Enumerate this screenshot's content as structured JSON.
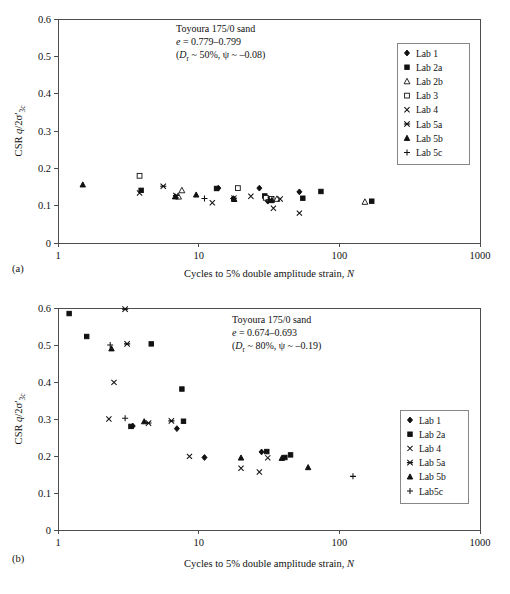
{
  "figure": {
    "axis": {
      "x_label_prefix": "Cycles to 5% double amplitude strain, ",
      "x_label_italic": "N",
      "y_label_main": "CSR ",
      "y_label_italic": "q",
      "y_label_rest": "/2σ′",
      "y_label_sub": "3c",
      "x_ticks": [
        "1",
        "10",
        "100",
        "1000"
      ],
      "y_ticks": [
        "0",
        "0.1",
        "0.2",
        "0.3",
        "0.4",
        "0.5",
        "0.6"
      ]
    },
    "captions": {
      "a": "(a)",
      "b": "(b)"
    }
  },
  "chart_data": [
    {
      "id": "panel-a",
      "type": "scatter",
      "caption": "(a)",
      "title": "",
      "xlabel": "Cycles to 5% double amplitude strain, N",
      "ylabel": "CSR q/2σ′3c",
      "xscale": "log",
      "xlim": [
        1,
        1000
      ],
      "ylim": [
        0,
        0.6
      ],
      "ytick_step": 0.1,
      "grid": false,
      "legend_position": "top-right",
      "annotation": {
        "line1": "Toyoura 175/0 sand",
        "line2_italic": "e",
        "line2_rest": " = 0.779–0.799",
        "line3_prefix": "(",
        "line3_italic": "D",
        "line3_sub": "r",
        "line3_rest": " ~ 50%, ψ ~ –0.08)"
      },
      "series": [
        {
          "name": "Lab 1",
          "marker": "filled-diamond",
          "points": [
            [
              13.8,
              0.147
            ],
            [
              17.6,
              0.119
            ],
            [
              27.0,
              0.147
            ],
            [
              31.0,
              0.112
            ],
            [
              52.0,
              0.137
            ]
          ]
        },
        {
          "name": "Lab 2a",
          "marker": "filled-square",
          "points": [
            [
              3.9,
              0.141
            ],
            [
              13.4,
              0.146
            ],
            [
              29.5,
              0.126
            ],
            [
              55.0,
              0.12
            ],
            [
              74.0,
              0.138
            ],
            [
              170.0,
              0.112
            ]
          ]
        },
        {
          "name": "Lab 2b",
          "marker": "open-triangle",
          "points": [
            [
              7.6,
              0.141
            ],
            [
              7.2,
              0.124
            ],
            [
              31.5,
              0.118
            ],
            [
              36.0,
              0.118
            ],
            [
              152.0,
              0.11
            ]
          ]
        },
        {
          "name": "Lab 3",
          "marker": "open-square",
          "points": [
            [
              3.8,
              0.18
            ],
            [
              19.0,
              0.147
            ],
            [
              30.0,
              0.121
            ],
            [
              33.0,
              0.118
            ]
          ]
        },
        {
          "name": "Lab 4",
          "marker": "cross-x",
          "points": [
            [
              3.8,
              0.134
            ],
            [
              12.5,
              0.108
            ],
            [
              23.5,
              0.125
            ],
            [
              34.0,
              0.093
            ],
            [
              38.0,
              0.118
            ],
            [
              52.0,
              0.08
            ]
          ]
        },
        {
          "name": "Lab 5a",
          "marker": "star-x",
          "points": [
            [
              5.6,
              0.152
            ],
            [
              6.9,
              0.127
            ],
            [
              17.8,
              0.12
            ],
            [
              32.5,
              0.115
            ]
          ]
        },
        {
          "name": "Lab 5b",
          "marker": "filled-triangle",
          "points": [
            [
              1.5,
              0.156
            ],
            [
              6.8,
              0.124
            ],
            [
              9.6,
              0.129
            ],
            [
              17.9,
              0.117
            ],
            [
              33.0,
              0.114
            ]
          ]
        },
        {
          "name": "Lab 5c",
          "marker": "plus",
          "points": [
            [
              11.0,
              0.119
            ],
            [
              31.5,
              0.116
            ]
          ]
        }
      ]
    },
    {
      "id": "panel-b",
      "type": "scatter",
      "caption": "(b)",
      "title": "",
      "xlabel": "Cycles to 5% double amplitude strain, N",
      "ylabel": "CSR q/2σ′3c",
      "xscale": "log",
      "xlim": [
        1,
        1000
      ],
      "ylim": [
        0,
        0.6
      ],
      "ytick_step": 0.1,
      "grid": false,
      "legend_position": "right",
      "annotation": {
        "line1": "Toyoura 175/0 sand",
        "line2_italic": "e",
        "line2_rest": " = 0.674–0.693",
        "line3_prefix": "(",
        "line3_italic": "D",
        "line3_sub": "r",
        "line3_rest": " ~ 80%, ψ ~ –0.19)"
      },
      "series": [
        {
          "name": "Lab 1",
          "marker": "filled-diamond",
          "points": [
            [
              3.4,
              0.281
            ],
            [
              7.0,
              0.274
            ],
            [
              11.0,
              0.196
            ],
            [
              28.0,
              0.211
            ]
          ]
        },
        {
          "name": "Lab 2a",
          "marker": "filled-square",
          "points": [
            [
              1.2,
              0.585
            ],
            [
              1.6,
              0.523
            ],
            [
              4.6,
              0.503
            ],
            [
              7.6,
              0.381
            ],
            [
              3.3,
              0.28
            ],
            [
              7.8,
              0.294
            ],
            [
              30.5,
              0.212
            ],
            [
              45.0,
              0.203
            ],
            [
              41.0,
              0.196
            ]
          ]
        },
        {
          "name": "Lab 4",
          "marker": "cross-x",
          "points": [
            [
              2.5,
              0.399
            ],
            [
              2.3,
              0.3
            ],
            [
              8.6,
              0.199
            ],
            [
              20.0,
              0.167
            ],
            [
              27.0,
              0.157
            ],
            [
              31.0,
              0.195
            ]
          ]
        },
        {
          "name": "Lab 5a",
          "marker": "star-x",
          "points": [
            [
              3.0,
              0.597
            ],
            [
              3.1,
              0.503
            ],
            [
              4.4,
              0.289
            ],
            [
              6.4,
              0.295
            ]
          ]
        },
        {
          "name": "Lab 5b",
          "marker": "filled-triangle",
          "points": [
            [
              2.4,
              0.49
            ],
            [
              4.1,
              0.293
            ],
            [
              20.0,
              0.195
            ],
            [
              39.0,
              0.194
            ],
            [
              60.0,
              0.169
            ]
          ]
        },
        {
          "name": "Lab 5c",
          "marker": "plus",
          "points": [
            [
              2.35,
              0.5
            ],
            [
              3.0,
              0.302
            ],
            [
              125.0,
              0.145
            ]
          ]
        }
      ],
      "legend_labels": [
        "Lab 1",
        "Lab 2a",
        "Lab 4",
        "Lab 5a",
        "Lab 5b",
        "Lab5c"
      ]
    }
  ]
}
